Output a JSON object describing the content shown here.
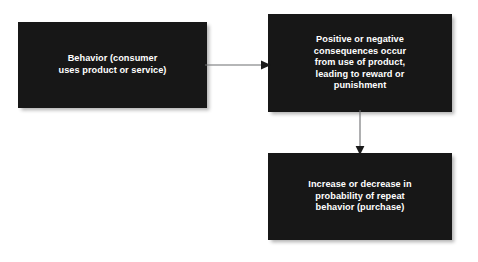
{
  "diagram": {
    "type": "flowchart",
    "orientation": "left-to-right then top-to-bottom",
    "background_color": "#ffffff",
    "node_fill_color": "#171717",
    "node_text_color": "#ffffff",
    "connector_color": "#58595b",
    "nodes": [
      {
        "id": "behavior",
        "label": "Behavior (consumer\nuses product or service)",
        "lines": [
          "Behavior (consumer",
          "uses product or service)"
        ]
      },
      {
        "id": "consequences",
        "label": "Positive or negative\nconsequences occur\nfrom use of product,\nleading to reward or\npunishment",
        "lines": [
          "Positive or negative",
          "consequences occur",
          "from use of product,",
          "leading to reward or",
          "punishment"
        ]
      },
      {
        "id": "probability",
        "label": "Increase or decrease in\nprobability of repeat\nbehavior (purchase)",
        "lines": [
          "Increase or decrease in",
          "probability of repeat",
          "behavior (purchase)"
        ]
      }
    ],
    "connectors": [
      {
        "id": "behavior-to-consequences",
        "from": "behavior",
        "to": "consequences",
        "direction": "right",
        "style": "solid-arrow"
      },
      {
        "id": "consequences-to-probability",
        "from": "consequences",
        "to": "probability",
        "direction": "down",
        "style": "solid-arrow"
      }
    ]
  }
}
